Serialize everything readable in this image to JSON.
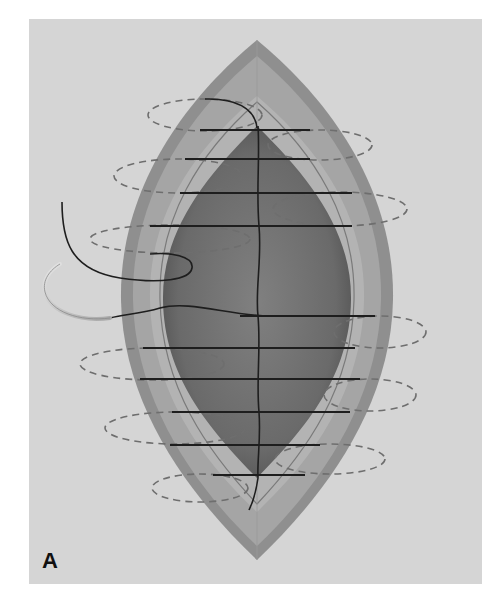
{
  "figure": {
    "panel_label": "A",
    "colors": {
      "page_bg": "#ffffff",
      "panel_bg": "#d5d5d5",
      "skin_outer": "#8f8f8f",
      "skin_band": "#a3a3a3",
      "dermis": "#b4b4b4",
      "wound_bed_dark": "#5a5a5a",
      "wound_bed_mid": "#7a7a7a",
      "suture_line": "#1e1e1e",
      "dashed_loop": "#6e6e6e",
      "needle": "#c8c8c8"
    },
    "stitch_rows_y": [
      130,
      159,
      193,
      226,
      316,
      348,
      379,
      412,
      445,
      475
    ],
    "loop_sides": [
      "left",
      "right",
      "left",
      "right",
      "left",
      "right",
      "left",
      "right",
      "left",
      "right"
    ]
  }
}
